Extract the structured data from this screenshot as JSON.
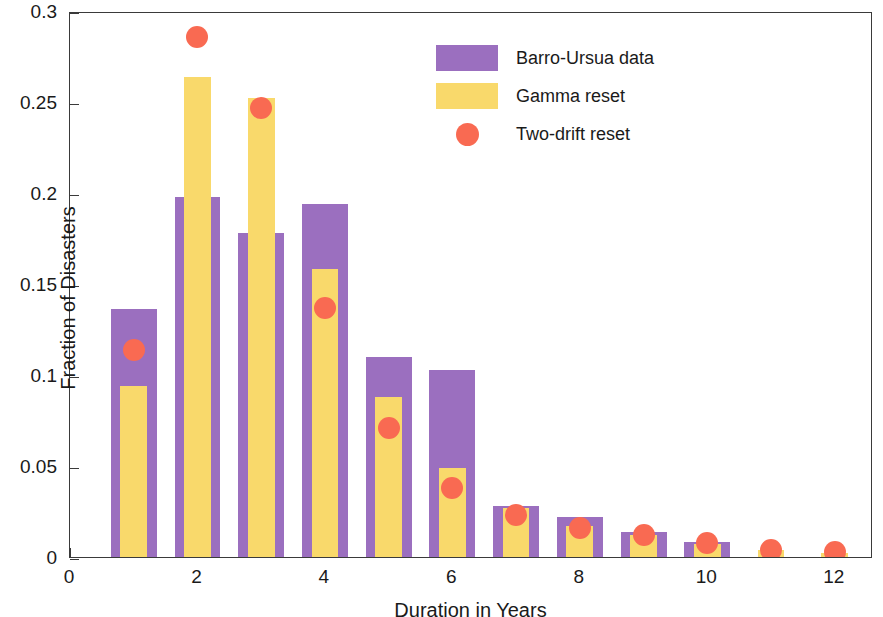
{
  "chart_data": {
    "type": "bar",
    "title": "",
    "xlabel": "Duration in Years",
    "ylabel": "Fraction of Disasters",
    "xlim": [
      0,
      12.6
    ],
    "ylim": [
      0,
      0.3
    ],
    "xticks": [
      0,
      2,
      4,
      6,
      8,
      10,
      12
    ],
    "xtick_labels": [
      "0",
      "2",
      "4",
      "6",
      "8",
      "10",
      "12"
    ],
    "yticks": [
      0,
      0.05,
      0.1,
      0.15,
      0.2,
      0.25,
      0.3
    ],
    "ytick_labels": [
      "0",
      "0.05",
      "0.1",
      "0.15",
      "0.2",
      "0.25",
      "0.3"
    ],
    "grid": false,
    "legend_position": "top-center",
    "categories": [
      1,
      2,
      3,
      4,
      5,
      6,
      7,
      8,
      9,
      10,
      11,
      12
    ],
    "series": [
      {
        "name": "Barro-Ursua data",
        "type": "bar",
        "color": "#9B6FBF",
        "bar_width": 0.72,
        "values": [
          0.136,
          0.198,
          0.178,
          0.194,
          0.11,
          0.103,
          0.028,
          0.022,
          0.014,
          0.008,
          0.0,
          0.0
        ]
      },
      {
        "name": "Gamma reset",
        "type": "bar",
        "color": "#F9D96B",
        "bar_width": 0.42,
        "values": [
          0.094,
          0.264,
          0.252,
          0.158,
          0.088,
          0.049,
          0.027,
          0.017,
          0.012,
          0.007,
          0.004,
          0.002
        ]
      },
      {
        "name": "Two-drift reset",
        "type": "scatter",
        "color": "#F96A52",
        "marker": "circle",
        "marker_size": 22,
        "values": [
          0.115,
          0.287,
          0.248,
          0.138,
          0.072,
          0.039,
          0.024,
          0.017,
          0.013,
          0.009,
          0.005,
          0.004
        ]
      }
    ]
  },
  "legend": {
    "items": [
      {
        "label": "Barro-Ursua data",
        "swatch": "rect",
        "color": "#9B6FBF"
      },
      {
        "label": "Gamma reset",
        "swatch": "rect",
        "color": "#F9D96B"
      },
      {
        "label": "Two-drift reset",
        "swatch": "circle",
        "color": "#F96A52"
      }
    ]
  },
  "colors": {
    "purple": "#9B6FBF",
    "yellow": "#F9D96B",
    "red": "#F96A52",
    "axis": "#3a3a3a",
    "text": "#1a1a1a",
    "background": "#ffffff"
  }
}
